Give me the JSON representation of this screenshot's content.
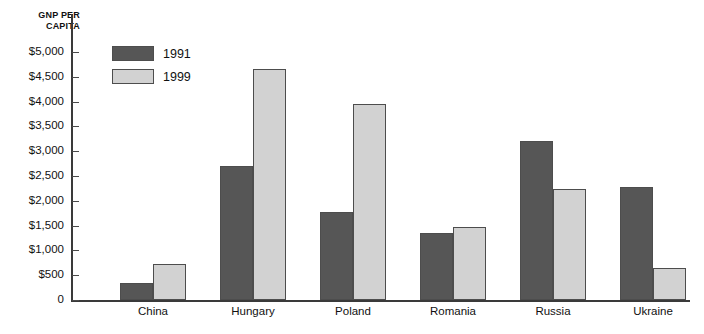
{
  "chart_data": {
    "type": "bar",
    "title": "",
    "ylabel": "GNP PER CAPITA",
    "xlabel": "",
    "categories": [
      "China",
      "Hungary",
      "Poland",
      "Romania",
      "Russia",
      "Ukraine"
    ],
    "series": [
      {
        "name": "1991",
        "color": "#565656",
        "values": [
          350,
          2700,
          1780,
          1360,
          3200,
          2280
        ]
      },
      {
        "name": "1999",
        "color": "#d2d2d2",
        "values": [
          730,
          4650,
          3950,
          1480,
          2230,
          650
        ]
      }
    ],
    "ylim": [
      0,
      5000
    ],
    "ytick_values": [
      0,
      500,
      1000,
      1500,
      2000,
      2500,
      3000,
      3500,
      4000,
      4500,
      5000
    ],
    "ytick_labels": [
      "0",
      "$500",
      "$1,000",
      "$1,500",
      "$2,000",
      "$2,500",
      "$3,000",
      "$3,500",
      "$4,000",
      "$4,500",
      "$5,000"
    ],
    "grid": false,
    "legend_position": "top-left"
  }
}
